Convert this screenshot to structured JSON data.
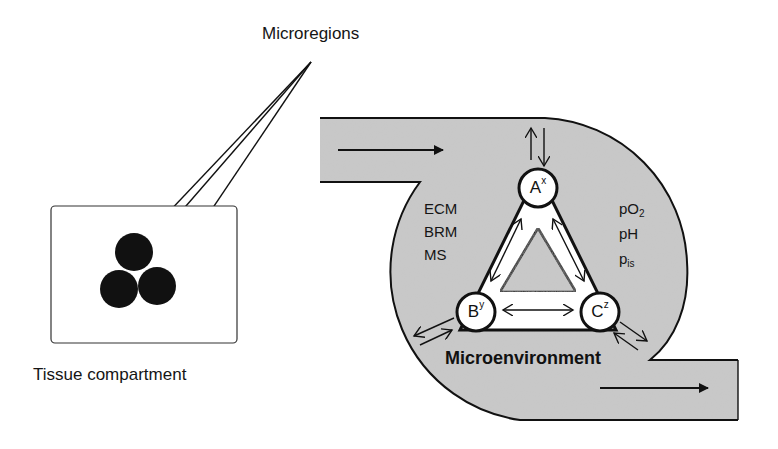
{
  "labels": {
    "microregions": "Microregions",
    "tissue_compartment": "Tissue compartment",
    "microenvironment": "Microenvironment"
  },
  "left_factors": [
    "ECM",
    "BRM",
    "MS"
  ],
  "right_factors": [
    {
      "base": "pO",
      "sub": "2"
    },
    {
      "base": "pH",
      "sub": ""
    },
    {
      "base": "p",
      "sub": "is"
    }
  ],
  "nodes": [
    {
      "id": "A",
      "letter": "A",
      "superscript": "x"
    },
    {
      "id": "B",
      "letter": "B",
      "superscript": "y"
    },
    {
      "id": "C",
      "letter": "C",
      "superscript": "z"
    }
  ],
  "colors": {
    "fill": "#c9c9c9",
    "stroke": "#111111",
    "background": "#ffffff"
  }
}
